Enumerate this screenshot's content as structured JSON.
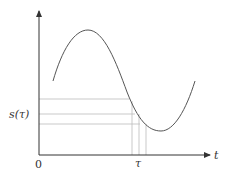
{
  "diagram": {
    "type": "function-plot",
    "labels": {
      "x_axis": "t",
      "y_value": "s(τ)",
      "origin": "0",
      "x_point": "τ"
    },
    "curve": "sinusoid",
    "guide_lines": {
      "horizontal_count": 3,
      "vertical_count": 3
    },
    "colors": {
      "axis": "#333333",
      "curve": "#555555",
      "guide": "#bbbbbb"
    }
  }
}
